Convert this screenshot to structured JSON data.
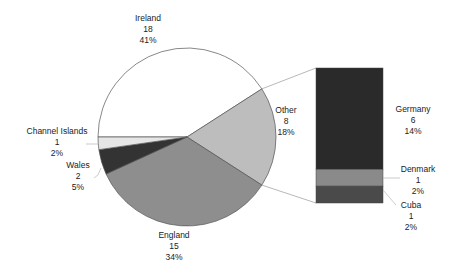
{
  "chart_data": {
    "type": "pie",
    "subtype": "bar-of-pie",
    "title": "",
    "pie": {
      "start_angle_deg": 180,
      "slices": [
        {
          "label": "Ireland",
          "value": 18,
          "percent": "41%",
          "color": "#ffffff"
        },
        {
          "label": "Other",
          "value": 8,
          "percent": "18%",
          "color": "#bdbdbd"
        },
        {
          "label": "England",
          "value": 15,
          "percent": "34%",
          "color": "#8e8e8e"
        },
        {
          "label": "Wales",
          "value": 2,
          "percent": "5%",
          "color": "#333333"
        },
        {
          "label": "Channel Islands",
          "value": 1,
          "percent": "2%",
          "color": "#e6e6e6"
        }
      ]
    },
    "bar": {
      "breakdown_of": "Other",
      "segments": [
        {
          "label": "Germany",
          "value": 6,
          "percent": "14%",
          "color": "#2a2a2a"
        },
        {
          "label": "Denmark",
          "value": 1,
          "percent": "2%",
          "color": "#8a8a8a"
        },
        {
          "label": "Cuba",
          "value": 1,
          "percent": "2%",
          "color": "#4a4a4a"
        }
      ]
    },
    "legend": "none",
    "data_labels": "category, value, percent"
  }
}
